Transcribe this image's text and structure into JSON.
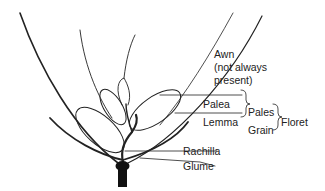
{
  "diagram": {
    "labels": {
      "awn": "Awn",
      "awn_note_1": "(not always",
      "awn_note_2": "present)",
      "palea": "Palea",
      "lemma": "Lemma",
      "pales": "Pales",
      "grain": "Grain",
      "floret": "Floret",
      "rachilla": "Rachilla",
      "glume": "Glume"
    },
    "colors": {
      "line": "#222222",
      "background": "#ffffff"
    }
  }
}
